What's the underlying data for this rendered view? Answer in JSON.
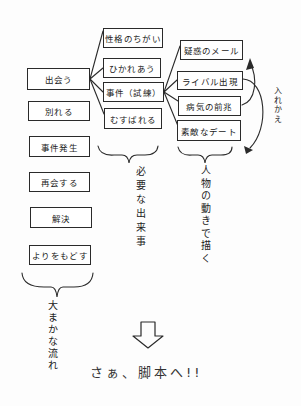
{
  "diagram": {
    "flow": {
      "label": "大まかな流れ",
      "steps": [
        "出会う",
        "別れる",
        "事件発生",
        "再会する",
        "解決",
        "よりをもどす"
      ]
    },
    "events": {
      "label": "必要な出来事",
      "items": [
        "性格のちがい",
        "ひかれあう",
        "事件（試練）",
        "むすばれる"
      ]
    },
    "character_actions": {
      "label": "人物の動きで描く",
      "items": [
        "疑惑のメール",
        "ライバル出現",
        "病気の前兆",
        "素敵なデート"
      ]
    },
    "swap_note": "入れかえ",
    "conclusion": "さぁ、脚本へ!!",
    "colors": {
      "stroke": "#2a2a2a",
      "background": "#fdfdfd"
    }
  }
}
